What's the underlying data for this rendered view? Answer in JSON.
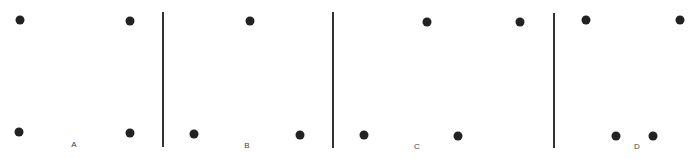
{
  "figure": {
    "panels": [
      {
        "label": "A",
        "label_pos": [
          74,
          144
        ],
        "dots": [
          [
            20,
            20
          ],
          [
            130,
            21
          ],
          [
            19,
            132
          ],
          [
            130,
            133
          ]
        ]
      },
      {
        "label": "B",
        "label_pos": [
          247,
          145
        ],
        "dots": [
          [
            250,
            21
          ],
          [
            194,
            134
          ],
          [
            300,
            135
          ]
        ]
      },
      {
        "label": "C",
        "label_pos": [
          417,
          146
        ],
        "dots": [
          [
            427,
            22
          ],
          [
            520,
            22
          ],
          [
            364,
            135
          ],
          [
            458,
            136
          ]
        ]
      },
      {
        "label": "D",
        "label_pos": [
          637,
          146
        ],
        "dots": [
          [
            586,
            20
          ],
          [
            680,
            20
          ],
          [
            616,
            136
          ],
          [
            653,
            136
          ]
        ]
      }
    ],
    "dividers": [
      {
        "x": 163,
        "y1": 12,
        "y2": 147
      },
      {
        "x": 333,
        "y1": 12,
        "y2": 148
      },
      {
        "x": 554,
        "y1": 13,
        "y2": 148
      }
    ],
    "colors": {
      "dot": "#222222",
      "divider": "#333333",
      "label": "#444444"
    }
  }
}
